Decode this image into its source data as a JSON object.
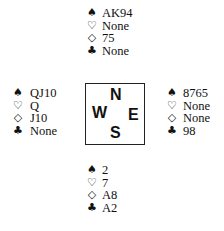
{
  "hands": {
    "north": {
      "spades": "AK94",
      "hearts": "None",
      "diamonds": "75",
      "clubs": "None"
    },
    "west": {
      "spades": "QJ10",
      "hearts": "Q",
      "diamonds": "J10",
      "clubs": "None"
    },
    "east": {
      "spades": "8765",
      "hearts": "None",
      "diamonds": "None",
      "clubs": "98"
    },
    "south": {
      "spades": "2",
      "hearts": "7",
      "diamonds": "A8",
      "clubs": "A2"
    }
  },
  "symbols": {
    "spades": "♠",
    "hearts": "♡",
    "diamonds": "◇",
    "clubs": "♣"
  },
  "compass": {
    "n": "N",
    "w": "W",
    "e": "E",
    "s": "S"
  }
}
